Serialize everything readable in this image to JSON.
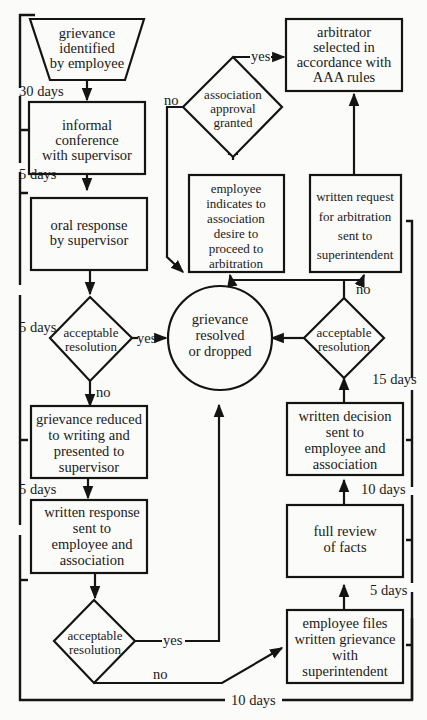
{
  "colors": {
    "ink": "#141414",
    "paper": "#fbfbf9"
  },
  "nodes": {
    "identified": {
      "lines": [
        "grievance",
        "identified",
        "by employee"
      ],
      "shape": "trapezoid"
    },
    "informal": {
      "lines": [
        "informal",
        "conference",
        "with supervisor"
      ],
      "shape": "rect"
    },
    "oral": {
      "lines": [
        "oral response",
        "by supervisor"
      ],
      "shape": "rect"
    },
    "decision1": {
      "lines": [
        "acceptable",
        "resolution"
      ],
      "shape": "diamond"
    },
    "reduced": {
      "lines": [
        "grievance  reduced",
        "to  writing  and",
        "presented  to",
        "supervisor"
      ],
      "shape": "rect"
    },
    "written_response": {
      "lines": [
        "written  response",
        "sent to",
        "employee  and",
        "association"
      ],
      "shape": "rect"
    },
    "decision2": {
      "lines": [
        "acceptable",
        "resolution"
      ],
      "shape": "diamond"
    },
    "resolved": {
      "lines": [
        "grievance",
        "resolved",
        "or dropped"
      ],
      "shape": "circle"
    },
    "files": {
      "lines": [
        "employee files",
        "written grievance",
        "with",
        "superintendent"
      ],
      "shape": "rect"
    },
    "review": {
      "lines": [
        "full review",
        "of facts"
      ],
      "shape": "rect"
    },
    "written_decision": {
      "lines": [
        "written  decision",
        "sent to",
        "employee and",
        "association"
      ],
      "shape": "rect"
    },
    "decision3": {
      "lines": [
        "acceptable",
        "resolution"
      ],
      "shape": "diamond"
    },
    "request": {
      "lines": [
        "written  request",
        "for  arbitration",
        "sent to",
        "superintendent"
      ],
      "shape": "rect"
    },
    "indicates": {
      "lines": [
        "employee",
        "indicates to",
        "association",
        "desire to",
        "proceed to",
        "arbitration"
      ],
      "shape": "rect"
    },
    "approval": {
      "lines": [
        "association",
        "approval",
        "granted"
      ],
      "shape": "diamond"
    },
    "arbitrator": {
      "lines": [
        "arbitrator",
        "selected in",
        "accordance with",
        "AAA rules"
      ],
      "shape": "rect"
    }
  },
  "edge_labels": {
    "d1_yes": "yes",
    "d1_no": "no",
    "d2_yes": "yes",
    "d2_no": "no",
    "d3_no": "no",
    "approval_yes": "yes",
    "approval_no": "no"
  },
  "time_limits": {
    "left": [
      "30 days",
      "5 days",
      "5 days",
      "5 days"
    ],
    "right": [
      "15 days",
      "10 days",
      "5 days"
    ],
    "bottom": "10 days"
  }
}
